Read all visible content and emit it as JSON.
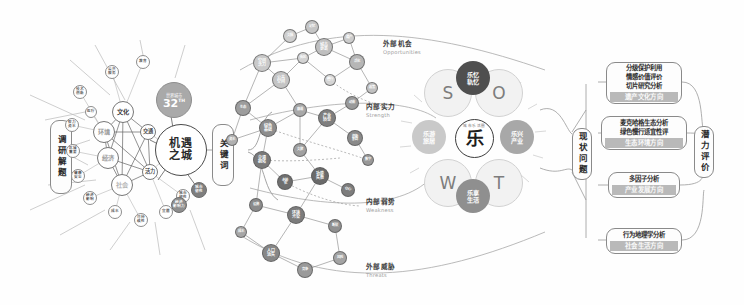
{
  "diagram": {
    "palette": {
      "ink": "#2b2b2b",
      "line": "#7d7d7d",
      "node_light": "#e9e9e9",
      "node_mid": "#bdbdbd",
      "node_dark": "#6e6e6e",
      "node_darkest": "#4a4a4a",
      "highlight_bar": "#b9b9b9",
      "swot_dark": "#4f4f4f",
      "swot_mid": "#8f8f8f",
      "swot_light": "#c9c9c9"
    }
  },
  "left_panel": {
    "stage_label": "调研解题",
    "hub_label": "机遇之城",
    "badge": {
      "caption": "世界城市",
      "rank": "32",
      "suffix": "TH"
    },
    "core_nodes": [
      {
        "label": "文化",
        "x": 123,
        "y": 112,
        "r": 11,
        "fill": "#ffffff",
        "text": "#3a3a3a",
        "size": 6.2
      },
      {
        "label": "环境",
        "x": 104,
        "y": 132,
        "r": 11,
        "fill": "#ffffff",
        "text": "#9b9b9b",
        "size": 6.2
      },
      {
        "label": "经济",
        "x": 108,
        "y": 158,
        "r": 11,
        "fill": "#ffffff",
        "text": "#9b9b9b",
        "size": 6.2
      },
      {
        "label": "社会",
        "x": 122,
        "y": 185,
        "r": 11,
        "fill": "#ffffff",
        "text": "#b4b4b4",
        "size": 6.2
      },
      {
        "label": "交通",
        "x": 148,
        "y": 132,
        "r": 8,
        "fill": "#ffffff",
        "text": "#4a4a4a",
        "size": 5.2
      },
      {
        "label": "活力",
        "x": 150,
        "y": 172,
        "r": 8,
        "fill": "#ffffff",
        "text": "#4a4a4a",
        "size": 5.2
      }
    ],
    "satellite_nodes": [
      {
        "label": "公共\n服务",
        "x": 112,
        "y": 72,
        "r": 7
      },
      {
        "label": "教育",
        "x": 143,
        "y": 62,
        "r": 7
      },
      {
        "label": "技术\n创新",
        "x": 80,
        "y": 92,
        "r": 7
      },
      {
        "label": "医疗",
        "x": 91,
        "y": 112,
        "r": 6
      },
      {
        "label": "智力\n资本",
        "x": 72,
        "y": 125,
        "r": 7
      },
      {
        "label": "区域\n重要",
        "x": 73,
        "y": 151,
        "r": 7
      },
      {
        "label": "健康\n安全",
        "x": 78,
        "y": 176,
        "r": 7
      },
      {
        "label": "经济\n影响",
        "x": 90,
        "y": 198,
        "r": 7
      },
      {
        "label": "成本",
        "x": 115,
        "y": 212,
        "r": 7
      },
      {
        "label": "可持\n续性",
        "x": 141,
        "y": 220,
        "r": 7
      },
      {
        "label": "宜居",
        "x": 166,
        "y": 212,
        "r": 7
      },
      {
        "label": "城市\n韧性",
        "x": 183,
        "y": 196,
        "r": 7
      }
    ],
    "dark_nodes": [
      {
        "label": "经济\n影响力",
        "x": 179,
        "y": 205,
        "r": 8,
        "fill": "#8e8e8e"
      },
      {
        "label": "城市\n韧性",
        "x": 199,
        "y": 190,
        "r": 8,
        "fill": "#7e7e7e"
      }
    ]
  },
  "keyword_panel": {
    "label": "关键词"
  },
  "swot_quadrants": [
    {
      "cn": "外部机会",
      "en": "Opportunities",
      "x": 383,
      "y": 38
    },
    {
      "cn": "内部实力",
      "en": "Strength",
      "x": 366,
      "y": 101
    },
    {
      "cn": "内部弱势",
      "en": "Weakness",
      "x": 366,
      "y": 196
    },
    {
      "cn": "外部威胁",
      "en": "Threats",
      "x": 366,
      "y": 261
    }
  ],
  "network": {
    "note": "关键词共现网络",
    "nodes": [
      {
        "x": 262,
        "y": 63,
        "r": 9,
        "shade": "#c9c9c9",
        "label": "空间\n活力"
      },
      {
        "x": 290,
        "y": 36,
        "r": 7,
        "shade": "#cfcfcf",
        "label": "文脉"
      },
      {
        "x": 312,
        "y": 27,
        "r": 7,
        "shade": "#c5c5c5",
        "label": "记忆"
      },
      {
        "x": 324,
        "y": 47,
        "r": 9,
        "shade": "#bfbfbf",
        "label": "城市\n更新"
      },
      {
        "x": 349,
        "y": 38,
        "r": 6,
        "shade": "#cccccc",
        "label": "遗产"
      },
      {
        "x": 303,
        "y": 58,
        "r": 6,
        "shade": "#d2d2d2",
        "label": "街区"
      },
      {
        "x": 281,
        "y": 80,
        "r": 9,
        "shade": "#c4c4c4",
        "label": "公共\n空间"
      },
      {
        "x": 357,
        "y": 62,
        "r": 8,
        "shade": "#b6b6b6",
        "label": "活化"
      },
      {
        "x": 330,
        "y": 80,
        "r": 6,
        "shade": "#d4d4d4",
        "label": "慢行"
      },
      {
        "x": 243,
        "y": 108,
        "r": 8,
        "shade": "#9d9d9d",
        "label": "生态"
      },
      {
        "x": 268,
        "y": 128,
        "r": 9,
        "shade": "#8d8d8d",
        "label": "绿色\n基础"
      },
      {
        "x": 300,
        "y": 110,
        "r": 7,
        "shade": "#a8a8a8",
        "label": "廊道"
      },
      {
        "x": 327,
        "y": 118,
        "r": 9,
        "shade": "#7f7f7f",
        "label": "产业\n转型"
      },
      {
        "x": 352,
        "y": 103,
        "r": 7,
        "shade": "#9a9a9a",
        "label": "动能"
      },
      {
        "x": 355,
        "y": 138,
        "r": 8,
        "shade": "#8a8a8a",
        "label": "创新\n集群"
      },
      {
        "x": 300,
        "y": 150,
        "r": 7,
        "shade": "#a0a0a0",
        "label": "文旅"
      },
      {
        "x": 262,
        "y": 160,
        "r": 9,
        "shade": "#7a7a7a",
        "label": "交通\n拥堵"
      },
      {
        "x": 285,
        "y": 182,
        "r": 8,
        "shade": "#6f6f6f",
        "label": "老龄\n化"
      },
      {
        "x": 320,
        "y": 176,
        "r": 9,
        "shade": "#6a6a6a",
        "label": "功能\n失衡"
      },
      {
        "x": 348,
        "y": 190,
        "r": 7,
        "shade": "#7d7d7d",
        "label": "空心"
      },
      {
        "x": 256,
        "y": 205,
        "r": 7,
        "shade": "#8b8b8b",
        "label": "设施"
      },
      {
        "x": 296,
        "y": 215,
        "r": 9,
        "shade": "#7c7c7c",
        "label": "环境\n污染"
      },
      {
        "x": 335,
        "y": 226,
        "r": 7,
        "shade": "#909090",
        "label": "断裂"
      },
      {
        "x": 271,
        "y": 253,
        "r": 9,
        "shade": "#878787",
        "label": "人口\n流失"
      },
      {
        "x": 305,
        "y": 270,
        "r": 8,
        "shade": "#9a9a9a",
        "label": "竞争"
      },
      {
        "x": 340,
        "y": 258,
        "r": 7,
        "shade": "#a4a4a4",
        "label": "风险"
      },
      {
        "x": 372,
        "y": 88,
        "r": 6,
        "shade": "#c0c0c0",
        "label": "政策"
      },
      {
        "x": 232,
        "y": 140,
        "r": 6,
        "shade": "#b0b0b0",
        "label": "资本"
      },
      {
        "x": 368,
        "y": 160,
        "r": 6,
        "shade": "#989898",
        "label": "数字"
      },
      {
        "x": 241,
        "y": 232,
        "r": 6,
        "shade": "#a6a6a6",
        "label": "成本"
      }
    ]
  },
  "swot_core": {
    "letters": [
      {
        "key": "S",
        "x": 447,
        "y": 92
      },
      {
        "key": "O",
        "x": 498,
        "y": 92
      },
      {
        "key": "W",
        "x": 447,
        "y": 182
      },
      {
        "key": "T",
        "x": 498,
        "y": 182
      }
    ],
    "themes": [
      {
        "label": "乐忆\n轨忆",
        "pos": "top",
        "x": 473,
        "y": 78,
        "fill": "#4f4f4f"
      },
      {
        "label": "乐兴\n产业",
        "pos": "right",
        "x": 517,
        "y": 137,
        "fill": "#a8a8a8"
      },
      {
        "label": "乐享\n生活",
        "pos": "bottom",
        "x": 473,
        "y": 196,
        "fill": "#8f8f8f"
      },
      {
        "label": "乐游\n旅居",
        "pos": "left",
        "x": 429,
        "y": 137,
        "fill": "#c9c9c9"
      }
    ],
    "logo": {
      "ring_text": "城市乐活圈",
      "character": "乐"
    }
  },
  "issue_label": {
    "label": "现状问题"
  },
  "potential_label": {
    "label": "潜力评价"
  },
  "method_boxes": [
    {
      "lines": [
        "分级保护利用",
        "情感价值评价",
        "切片研究分析"
      ],
      "highlight": "遗产文化方向",
      "x": 606,
      "y": 62,
      "w": 76,
      "h": 42
    },
    {
      "lines": [
        "麦克哈格生态分析",
        "绿色慢行适宜性评"
      ],
      "highlight": "生态环境方向",
      "x": 601,
      "y": 116,
      "w": 86,
      "h": 34
    },
    {
      "lines": [
        "多因子分析"
      ],
      "highlight": "产业发展方向",
      "x": 608,
      "y": 172,
      "w": 72,
      "h": 26
    },
    {
      "lines": [
        "行为地理学分析"
      ],
      "highlight": "社会生活方向",
      "x": 606,
      "y": 228,
      "w": 76,
      "h": 26
    }
  ]
}
